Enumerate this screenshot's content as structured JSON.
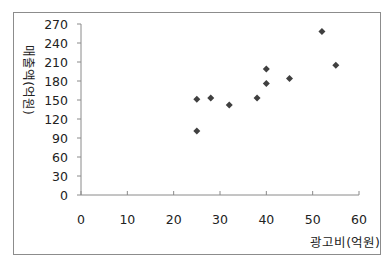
{
  "chart_data": {
    "type": "scatter",
    "title": "",
    "xlabel": "광고비(억원)",
    "ylabel": "매출액(억원)",
    "xlim": [
      0,
      60
    ],
    "ylim": [
      0,
      270
    ],
    "x_ticks": [
      0,
      10,
      20,
      30,
      40,
      50,
      60
    ],
    "y_ticks": [
      0,
      30,
      60,
      90,
      120,
      150,
      180,
      210,
      240,
      270
    ],
    "grid": false,
    "legend": null,
    "marker": "diamond",
    "marker_color": "#404040",
    "series": [
      {
        "name": "매출액",
        "points": [
          {
            "x": 25,
            "y": 101
          },
          {
            "x": 25,
            "y": 151
          },
          {
            "x": 28,
            "y": 153
          },
          {
            "x": 32,
            "y": 142
          },
          {
            "x": 38,
            "y": 153
          },
          {
            "x": 40,
            "y": 176
          },
          {
            "x": 40,
            "y": 199
          },
          {
            "x": 45,
            "y": 184
          },
          {
            "x": 52,
            "y": 258
          },
          {
            "x": 55,
            "y": 205
          }
        ]
      }
    ]
  },
  "labels": {
    "x_title": "광고비(억원)",
    "y_title": "매출액(억원)"
  }
}
